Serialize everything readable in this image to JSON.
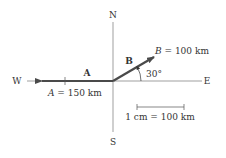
{
  "compass": {
    "north": "N",
    "south": "S",
    "east": "E",
    "west": "W"
  },
  "vectors": [
    {
      "name": "A",
      "label": "A",
      "magnitude_text": "150 km",
      "symbol": "A",
      "direction": "West",
      "angle_deg": 180,
      "color": "#4a4a4a"
    },
    {
      "name": "B",
      "label": "B",
      "magnitude_text": "100 km",
      "symbol": "B",
      "direction": "30° north of east",
      "angle_deg": 30,
      "color": "#4a4a4a"
    }
  ],
  "angle_label": "30°",
  "scale": {
    "label": "1 cm = 100 km"
  },
  "colors": {
    "axis": "#555555",
    "vector": "#4a4a4a",
    "text": "#333333"
  }
}
